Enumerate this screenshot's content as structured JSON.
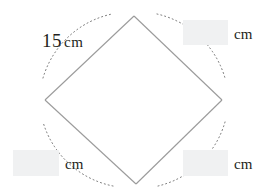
{
  "figure": {
    "name": "rhombus-with-arcs",
    "shape_label": "rhombus",
    "stroke_color": "#9b9b9b",
    "arc_color": "#6f6f6f",
    "text_color": "#231f20",
    "box_fill": "#f0f1f2",
    "background": "#ffffff",
    "vertices": {
      "top": {
        "x": 134,
        "y": 16
      },
      "right": {
        "x": 222,
        "y": 100
      },
      "bottom": {
        "x": 136,
        "y": 184
      },
      "left": {
        "x": 45,
        "y": 100
      }
    }
  },
  "labels": {
    "top_left_side": {
      "value": "15",
      "unit": "cm",
      "full_text": "15 cm"
    },
    "top_right_side": {
      "value": "",
      "unit": "cm",
      "placeholder": ""
    },
    "bottom_left_side": {
      "value": "",
      "unit": "cm",
      "placeholder": ""
    },
    "bottom_right_side": {
      "value": "",
      "unit": "cm",
      "placeholder": ""
    }
  }
}
